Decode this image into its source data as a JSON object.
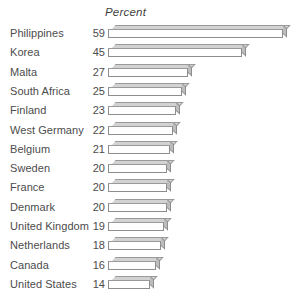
{
  "chart_data": {
    "type": "bar",
    "orientation": "horizontal",
    "title": "",
    "header_label": "Percent",
    "xlabel": "Percent",
    "ylabel": "",
    "grid": false,
    "legend": false,
    "xlim": [
      0,
      59
    ],
    "categories": [
      "Philippines",
      "Korea",
      "Malta",
      "South Africa",
      "Finland",
      "West Germany",
      "Belgium",
      "Sweden",
      "France",
      "Denmark",
      "United Kingdom",
      "Netherlands",
      "Canada",
      "United States"
    ],
    "values": [
      59,
      45,
      27,
      25,
      23,
      22,
      21,
      20,
      20,
      20,
      19,
      18,
      16,
      14
    ],
    "value_labels": [
      "59",
      "45",
      "27",
      "25",
      "23",
      "22",
      "21",
      "20",
      "20",
      "20",
      "19",
      "18",
      "16",
      "14"
    ],
    "style": {
      "background": "#ffffff",
      "bar_face": "#fefefe",
      "bar_outline": "#8d8d8d",
      "bar_top": "#d2d2d2",
      "bar_side": "#bdbdbd",
      "text": "#4c4c4c"
    }
  }
}
